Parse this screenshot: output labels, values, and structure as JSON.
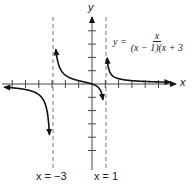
{
  "chart_data": {
    "type": "line",
    "title": "",
    "function": "y = x / ((x - 1)(x + 3))",
    "equation_label": {
      "lhs": "y =",
      "numerator": "x",
      "denominator": "(x − 1)(x + 3"
    },
    "xlabel": "x",
    "ylabel": "y",
    "xlim": [
      -7,
      6
    ],
    "ylim": [
      -5,
      5
    ],
    "grid": false,
    "vertical_asymptotes": [
      {
        "x": -3,
        "label": "x = −3"
      },
      {
        "x": 1,
        "label": "x = 1"
      }
    ],
    "horizontal_asymptote": {
      "y": 0
    },
    "x_ticks": [
      -6,
      -5,
      -4,
      -3,
      -2,
      -1,
      1,
      2,
      3,
      4,
      5
    ],
    "y_ticks": [
      -5,
      -4,
      -3,
      -2,
      -1,
      1,
      2,
      3,
      4
    ],
    "branches": [
      {
        "domain": [
          -7,
          -3.2
        ],
        "points": [
          [
            -7,
            -0.22
          ],
          [
            -6,
            -0.29
          ],
          [
            -5,
            -0.42
          ],
          [
            -4,
            -0.8
          ],
          [
            -3.5,
            -1.56
          ],
          [
            -3.25,
            -3.1
          ]
        ]
      },
      {
        "domain": [
          -2.7,
          0.85
        ],
        "points": [
          [
            -2.75,
            2.93
          ],
          [
            -2.5,
            1.43
          ],
          [
            -2,
            0.67
          ],
          [
            -1,
            0.25
          ],
          [
            0,
            0
          ],
          [
            0.5,
            -0.29
          ],
          [
            0.8,
            -1.05
          ]
        ]
      },
      {
        "domain": [
          1.15,
          5.5
        ],
        "points": [
          [
            1.15,
            1.84
          ],
          [
            1.5,
            0.67
          ],
          [
            2,
            0.4
          ],
          [
            3,
            0.25
          ],
          [
            4,
            0.19
          ],
          [
            5,
            0.16
          ]
        ]
      }
    ]
  },
  "labels": {
    "x_axis": "x",
    "y_axis": "y",
    "asymptote_left": "x = −3",
    "asymptote_right": "x = 1",
    "eq_lhs": "y =",
    "eq_num": "x",
    "eq_den": "(x − 1)(x + 3"
  }
}
